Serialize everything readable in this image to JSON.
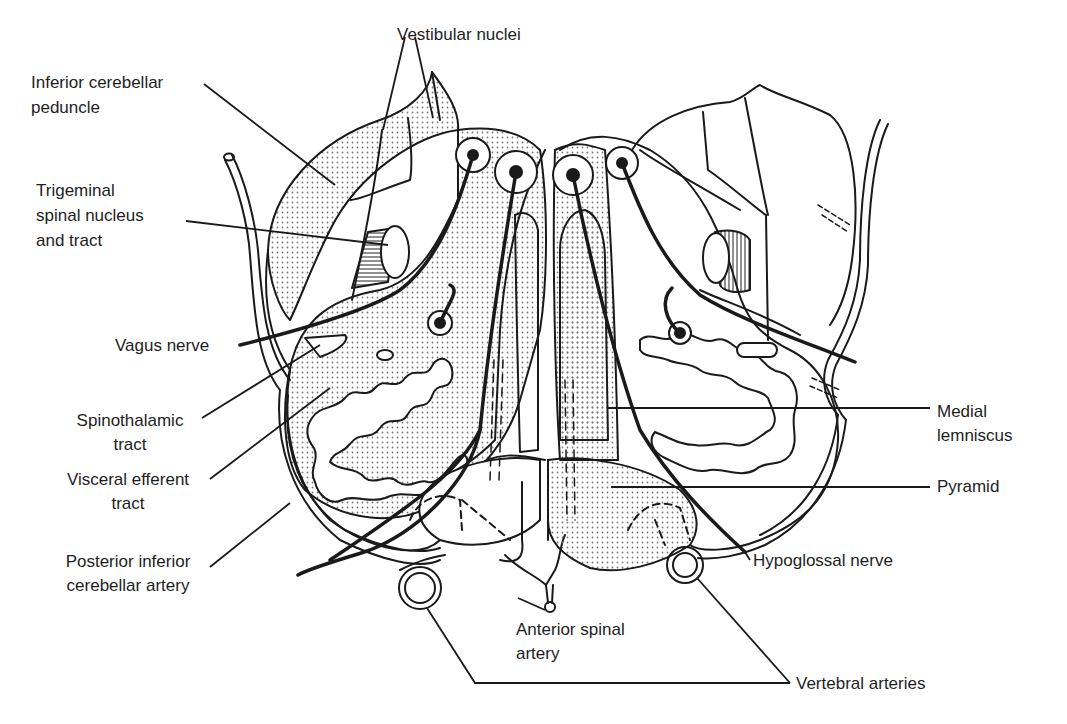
{
  "figure": {
    "labels": {
      "vestibular_nuclei": "Vestibular nuclei",
      "inferior_cerebellar_peduncle": [
        "Inferior cerebellar",
        "peduncle"
      ],
      "trigeminal": [
        "Trigeminal",
        "spinal nucleus",
        "and tract"
      ],
      "vagus_nerve": "Vagus nerve",
      "spinothalamic": [
        "Spinothalamic",
        "tract"
      ],
      "visceral_efferent": [
        "Visceral efferent",
        "tract"
      ],
      "pica": [
        "Posterior inferior",
        "cerebellar artery"
      ],
      "anterior_spinal": [
        "Anterior spinal",
        "artery"
      ],
      "vertebral_arteries": "Vertebral arteries",
      "hypoglossal_nerve": "Hypoglossal nerve",
      "pyramid": "Pyramid",
      "medial_lemniscus": [
        "Medial",
        "lemniscus"
      ]
    },
    "colors": {
      "line": "#1a1a1a",
      "stipple": "#9a9a9a",
      "background": "#ffffff"
    }
  }
}
